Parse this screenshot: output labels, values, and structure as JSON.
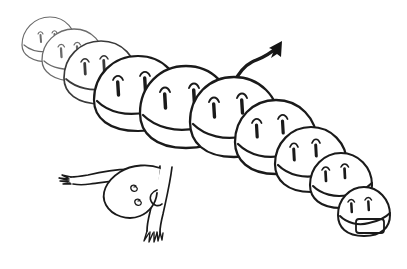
{
  "image": {
    "title": "Hand-drawn caterpillar creature line illustration",
    "kind": "line-art-illustration",
    "width": 407,
    "height": 269,
    "background_color": "#ffffff",
    "ink_color": "#1a1a1a",
    "faded_ink_color": "#6b6b6b",
    "style": "black ink on white, hand-drawn, no shading, no text"
  },
  "subject": {
    "name": "segmented caterpillar creature",
    "segment_count": 10,
    "arrangement": "diagonal chain receding from lower-right to upper-left",
    "perspective_note": "segments nearest viewer at lower-right drawn with heavier line; far segments at upper-left drawn thin and faded",
    "segments": [
      {
        "index": 1,
        "label": "far-tiny-segment",
        "cx": 48,
        "cy": 38,
        "rx": 26,
        "ry": 22,
        "weight": "faint",
        "has_eyes": true,
        "has_belly_band": true,
        "has_mouth": false
      },
      {
        "index": 2,
        "label": "far-small-segment",
        "cx": 72,
        "cy": 55,
        "rx": 30,
        "ry": 26,
        "weight": "faint",
        "has_eyes": true,
        "has_belly_band": true,
        "has_mouth": false
      },
      {
        "index": 3,
        "label": "distant-segment",
        "cx": 100,
        "cy": 73,
        "rx": 36,
        "ry": 31,
        "weight": "mid",
        "has_eyes": true,
        "has_belly_band": true,
        "has_mouth": false
      },
      {
        "index": 4,
        "label": "upper-mid-segment",
        "cx": 138,
        "cy": 94,
        "rx": 43,
        "ry": 38,
        "weight": "full",
        "has_eyes": true,
        "has_belly_band": true,
        "has_mouth": false
      },
      {
        "index": 5,
        "label": "center-segment",
        "cx": 186,
        "cy": 110,
        "rx": 46,
        "ry": 41,
        "weight": "full",
        "has_eyes": true,
        "has_belly_band": true,
        "has_mouth": false
      },
      {
        "index": 6,
        "label": "tail-anchor-segment",
        "cx": 234,
        "cy": 120,
        "rx": 45,
        "ry": 40,
        "weight": "full",
        "has_eyes": true,
        "has_belly_band": true,
        "has_mouth": false
      },
      {
        "index": 7,
        "label": "lower-mid-segment",
        "cx": 274,
        "cy": 140,
        "rx": 41,
        "ry": 37,
        "weight": "full",
        "has_eyes": true,
        "has_belly_band": true,
        "has_mouth": false
      },
      {
        "index": 8,
        "label": "near-segment",
        "cx": 309,
        "cy": 162,
        "rx": 36,
        "ry": 33,
        "weight": "full",
        "has_eyes": true,
        "has_belly_band": true,
        "has_mouth": false
      },
      {
        "index": 9,
        "label": "second-to-head",
        "cx": 340,
        "cy": 183,
        "rx": 31,
        "ry": 28,
        "weight": "full",
        "has_eyes": true,
        "has_belly_band": true,
        "has_mouth": false
      },
      {
        "index": 10,
        "label": "head-segment",
        "cx": 364,
        "cy": 215,
        "rx": 26,
        "ry": 24,
        "weight": "full",
        "has_eyes": true,
        "has_belly_band": true,
        "has_mouth": true
      }
    ],
    "eye_style": "closed eye drawn as a small caret arc above a thick tapered vertical stroke",
    "eyes_per_segment": 2,
    "mouth": {
      "on_segment": 10,
      "shape": "rounded rectangle",
      "description": "open rectangular mouth on the smallest front head"
    },
    "tail": {
      "label": "arrow-tipped tail",
      "attached_to_segment": 6,
      "description": "thin stalk rising from the top of the sixth segment, bending right and ending in a solid arrowhead pointing up-right",
      "arrow_tip": {
        "x": 282,
        "y": 41
      }
    }
  },
  "rider": {
    "label": "upside-down figure",
    "description": "small inverted head hanging below the caterpillar body with two spiral eyes and a curled snout",
    "head": {
      "cx": 128,
      "cy": 192,
      "rx": 30,
      "ry": 26
    },
    "eyes": [
      {
        "label": "spiral-eye-left",
        "cx": 134,
        "cy": 188,
        "type": "spiral"
      },
      {
        "label": "spiral-eye-right",
        "cx": 138,
        "cy": 202,
        "type": "spiral"
      }
    ],
    "snout": "curled hook line on the right side of the inverted head",
    "legs": [
      {
        "label": "upper-left-leg",
        "direction": "extends up-left to a toed foot",
        "foot": {
          "x": 66,
          "y": 176
        },
        "toe_count": 4
      },
      {
        "label": "lower-leg",
        "direction": "extends down to a toed foot",
        "foot": {
          "x": 157,
          "y": 233
        },
        "toe_count": 5
      }
    ]
  },
  "annotations": {
    "has_text": false,
    "has_border": false,
    "has_watermark": false,
    "color_count": 2
  }
}
